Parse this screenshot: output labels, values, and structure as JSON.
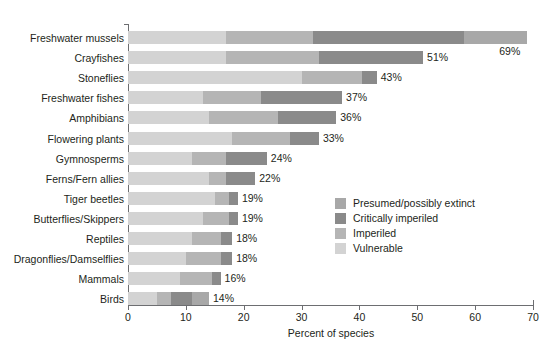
{
  "chart_data": {
    "type": "bar",
    "orientation": "horizontal",
    "stacked": true,
    "title": "",
    "xlabel": "Percent of species",
    "ylabel": "",
    "xlim": [
      0,
      70
    ],
    "xticks": [
      0,
      10,
      20,
      30,
      40,
      50,
      60,
      70
    ],
    "xticklabels": [
      "0",
      "10",
      "20",
      "30",
      "40",
      "50",
      "60",
      "70"
    ],
    "grid": false,
    "legend_position": "inside-right-middle",
    "categories": [
      "Freshwater mussels",
      "Crayfishes",
      "Stoneflies",
      "Freshwater fishes",
      "Amphibians",
      "Flowering plants",
      "Gymnosperms",
      "Ferns/Fern allies",
      "Tiger beetles",
      "Butterflies/Skippers",
      "Reptiles",
      "Dragonflies/Damselflies",
      "Mammals",
      "Birds"
    ],
    "series": [
      {
        "name": "Vulnerable",
        "color": "#d3d3d3",
        "values": [
          17,
          17,
          30,
          13,
          14,
          18,
          11,
          14,
          15,
          13,
          11,
          10,
          9,
          5
        ]
      },
      {
        "name": "Imperiled",
        "color": "#b5b5b5",
        "values": [
          15,
          16,
          10.5,
          10,
          12,
          10,
          6,
          3,
          2.5,
          4.5,
          5,
          6,
          5.5,
          2.5
        ]
      },
      {
        "name": "Critically imperiled",
        "color": "#8a8a8a",
        "values": [
          26,
          18,
          2.5,
          14,
          10,
          5,
          7,
          5,
          1.5,
          1.5,
          2,
          2,
          1.5,
          3.5
        ]
      },
      {
        "name": "Presumed/possibly extinct",
        "color": "#a8a8a8",
        "values": [
          11,
          0,
          0,
          0,
          0,
          0,
          0,
          0,
          0,
          0,
          0,
          0,
          0,
          3
        ]
      }
    ],
    "totals": [
      69,
      51,
      43,
      37,
      36,
      33,
      24,
      22,
      19,
      19,
      18,
      18,
      16,
      14
    ],
    "total_labels": [
      "69%",
      "51%",
      "43%",
      "37%",
      "36%",
      "33%",
      "24%",
      "22%",
      "19%",
      "19%",
      "18%",
      "18%",
      "16%",
      "14%"
    ],
    "annotations": [
      "The 69% total label for Freshwater mussels is placed below and to the right of its bar."
    ]
  },
  "legend": {
    "items": [
      {
        "label": "Presumed/possibly extinct",
        "color": "#a8a8a8"
      },
      {
        "label": "Critically imperiled",
        "color": "#8a8a8a"
      },
      {
        "label": "Imperiled",
        "color": "#b5b5b5"
      },
      {
        "label": "Vulnerable",
        "color": "#d3d3d3"
      }
    ]
  },
  "axis": {
    "x_title": "Percent of species"
  }
}
